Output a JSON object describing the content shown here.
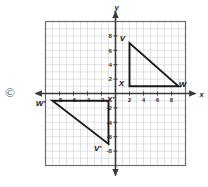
{
  "figure": {
    "copyright_symbol": "©",
    "axes": {
      "x_label": "x",
      "y_label": "y",
      "x_ticks": [
        {
          "value": -8,
          "label": "-8"
        },
        {
          "value": -6,
          "label": "-6"
        },
        {
          "value": -4,
          "label": "-4"
        },
        {
          "value": -2,
          "label": "-2"
        },
        {
          "value": 2,
          "label": "2"
        },
        {
          "value": 4,
          "label": "4"
        },
        {
          "value": 6,
          "label": "6"
        },
        {
          "value": 8,
          "label": "8"
        }
      ],
      "y_ticks": [
        {
          "value": 8,
          "label": "8"
        },
        {
          "value": 6,
          "label": "6"
        },
        {
          "value": 4,
          "label": "4"
        },
        {
          "value": 2,
          "label": "2"
        },
        {
          "value": -2,
          "label": "-2"
        },
        {
          "value": -4,
          "label": "-4"
        },
        {
          "value": -6,
          "label": "-6"
        },
        {
          "value": -8,
          "label": "-8"
        }
      ],
      "x_range": [
        -10,
        10
      ],
      "y_range": [
        -10,
        10
      ],
      "grid": true,
      "grid_step": 1
    },
    "shapes": [
      {
        "name": "triangle-VXW",
        "vertices": [
          {
            "label": "V",
            "x": 2,
            "y": 7,
            "label_dx": -7,
            "label_dy": -2
          },
          {
            "label": "X",
            "x": 2,
            "y": 1,
            "label_dx": -8,
            "label_dy": 0
          },
          {
            "label": "W",
            "x": 9,
            "y": 1,
            "label_dx": 4,
            "label_dy": 1
          }
        ]
      },
      {
        "name": "triangle-VprimeXprimeWprime",
        "vertices": [
          {
            "label": "X'",
            "x": -1,
            "y": -1,
            "label_dx": 2,
            "label_dy": 1
          },
          {
            "label": "W'",
            "x": -9,
            "y": -1,
            "label_dx": -12,
            "label_dy": 5
          },
          {
            "label": "V'",
            "x": -1,
            "y": -7,
            "label_dx": -11,
            "label_dy": 7
          }
        ]
      }
    ],
    "colors": {
      "grid_line": "#c9cdd4",
      "axis_line": "#3a3a3a",
      "shape_stroke": "#1a1a1a",
      "plot_border": "#6d6d6d",
      "text": "#1a1a1a"
    }
  }
}
